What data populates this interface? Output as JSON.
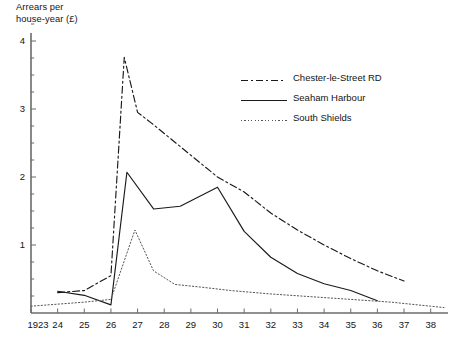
{
  "chart_data": {
    "type": "line",
    "title": "",
    "xlabel": "",
    "ylabel": "Arrears per\nhouse-year (£)",
    "xlim": [
      1923,
      1938.5
    ],
    "ylim": [
      0,
      4.3
    ],
    "y_major_ticks": [
      1,
      2,
      3,
      4
    ],
    "y_minor_step": 0.25,
    "grid": false,
    "legend_position": "upper right",
    "x_tick_labels": [
      "1923",
      "24",
      "25",
      "26",
      "27",
      "28",
      "29",
      "30",
      "31",
      "32",
      "33",
      "34",
      "35",
      "36",
      "37",
      "38"
    ],
    "x_tick_values": [
      1923,
      1924,
      1925,
      1926,
      1927,
      1928,
      1929,
      1930,
      1931,
      1932,
      1933,
      1934,
      1935,
      1936,
      1937,
      1938
    ],
    "y_tick_labels": [
      "1",
      "2",
      "3",
      "4"
    ],
    "series": [
      {
        "name": "Chester-le-Street RD",
        "style": "dash-dot",
        "color": "#1a1a1a",
        "x": [
          1924,
          1925,
          1926,
          1926.5,
          1927,
          1927.5,
          1929,
          1930,
          1931,
          1932,
          1933,
          1934,
          1935,
          1936,
          1937
        ],
        "y": [
          0.3,
          0.33,
          0.55,
          3.76,
          2.95,
          2.8,
          2.32,
          2.0,
          1.78,
          1.47,
          1.22,
          1.0,
          0.8,
          0.62,
          0.47
        ]
      },
      {
        "name": "Seaham Harbour",
        "style": "solid",
        "color": "#1a1a1a",
        "x": [
          1924,
          1925,
          1926,
          1926.6,
          1927.6,
          1928.6,
          1930,
          1931,
          1932,
          1933,
          1934,
          1935,
          1936
        ],
        "y": [
          0.32,
          0.26,
          0.12,
          2.07,
          1.53,
          1.57,
          1.85,
          1.2,
          0.82,
          0.58,
          0.43,
          0.33,
          0.18
        ]
      },
      {
        "name": "South Shields",
        "style": "dotted",
        "color": "#555555",
        "x": [
          1923,
          1924,
          1925,
          1926,
          1926.9,
          1927.6,
          1928.4,
          1929.4,
          1930.5,
          1932,
          1933.5,
          1935,
          1936.5,
          1938,
          1938.5
        ],
        "y": [
          0.1,
          0.13,
          0.16,
          0.2,
          1.22,
          0.62,
          0.42,
          0.38,
          0.33,
          0.28,
          0.24,
          0.2,
          0.16,
          0.1,
          0.08
        ]
      }
    ]
  },
  "axis": {
    "y_label_text": "Arrears per\nhouse-year (£)"
  },
  "legend": {
    "items": [
      {
        "label": "Chester-le-Street RD",
        "style": "dash-dot"
      },
      {
        "label": "Seaham Harbour",
        "style": "solid"
      },
      {
        "label": "South Shields",
        "style": "dotted"
      }
    ]
  }
}
